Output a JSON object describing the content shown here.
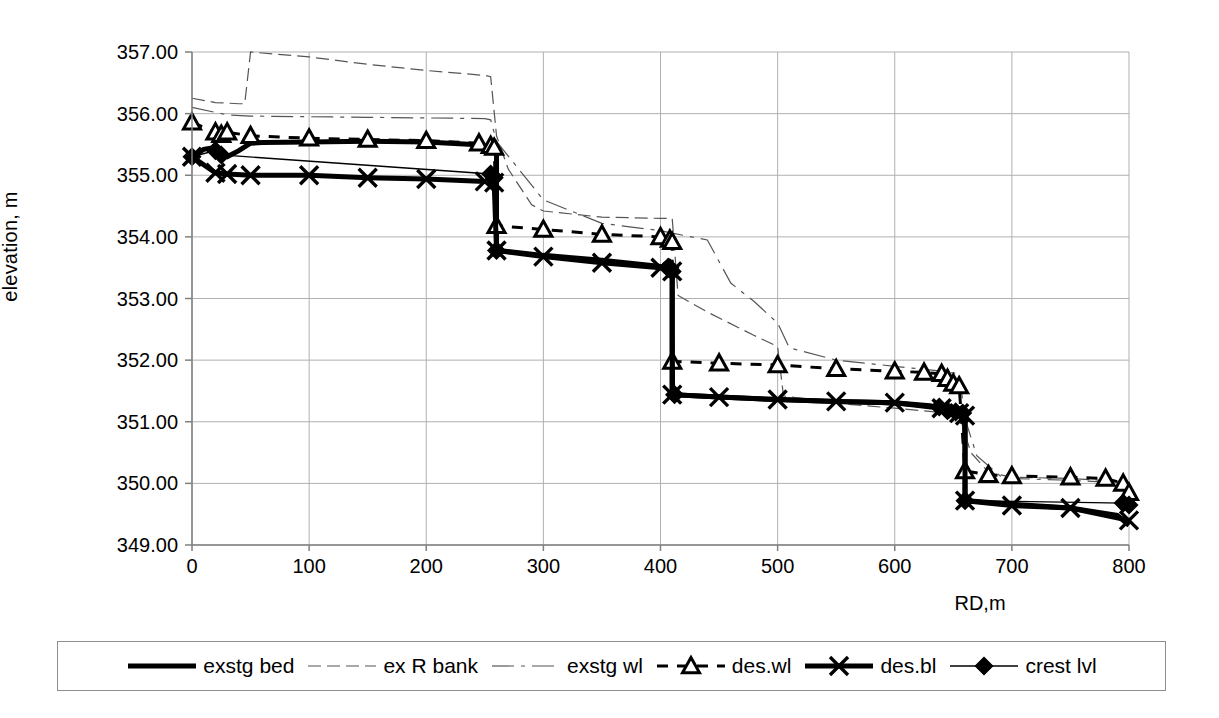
{
  "axes": {
    "y_title": "elevation, m",
    "x_title": "RD,m",
    "y_ticks": [
      "349.00",
      "350.00",
      "351.00",
      "352.00",
      "353.00",
      "354.00",
      "355.00",
      "356.00",
      "357.00"
    ],
    "x_ticks": [
      "0",
      "100",
      "200",
      "300",
      "400",
      "500",
      "600",
      "700",
      "800"
    ]
  },
  "legend": {
    "items": [
      {
        "label": "exstg bed",
        "style": "thick-solid",
        "marker": "none"
      },
      {
        "label": "ex R bank",
        "style": "thin-dashed",
        "marker": "none"
      },
      {
        "label": "exstg wl",
        "style": "thin-dash-dot-long",
        "marker": "none"
      },
      {
        "label": "des.wl",
        "style": "thin-dashed-marker",
        "marker": "triangle"
      },
      {
        "label": "des.bl",
        "style": "thick-solid-marker",
        "marker": "cross"
      },
      {
        "label": "crest lvl",
        "style": "thin-solid-marker",
        "marker": "diamond"
      }
    ]
  },
  "colors": {
    "line": "#000000",
    "grid": "#b0b0b0",
    "axis": "#808080",
    "background": "#ffffff"
  },
  "chart_data": {
    "type": "line",
    "title": "",
    "xlabel": "RD,m",
    "ylabel": "elevation, m",
    "xlim": [
      0,
      800
    ],
    "ylim": [
      349,
      357
    ],
    "ytick_step": 1,
    "xtick_step": 100,
    "grid": "both",
    "legend_position": "bottom",
    "series": [
      {
        "name": "exstg bed",
        "style": "thick-solid",
        "marker": "none",
        "points": [
          [
            0,
            355.3
          ],
          [
            10,
            355.42
          ],
          [
            20,
            355.45
          ],
          [
            25,
            355.33
          ],
          [
            30,
            355.3
          ],
          [
            40,
            355.4
          ],
          [
            50,
            355.52
          ],
          [
            60,
            355.53
          ],
          [
            100,
            355.54
          ],
          [
            150,
            355.55
          ],
          [
            200,
            355.54
          ],
          [
            240,
            355.5
          ],
          [
            250,
            355.47
          ],
          [
            258,
            355.42
          ],
          [
            260,
            355.4
          ],
          [
            260,
            353.78
          ],
          [
            262,
            353.78
          ],
          [
            300,
            353.7
          ],
          [
            350,
            353.62
          ],
          [
            400,
            353.52
          ],
          [
            408,
            353.46
          ],
          [
            410,
            353.44
          ],
          [
            410,
            351.44
          ],
          [
            412,
            351.44
          ],
          [
            450,
            351.4
          ],
          [
            500,
            351.36
          ],
          [
            550,
            351.33
          ],
          [
            600,
            351.31
          ],
          [
            630,
            351.26
          ],
          [
            640,
            351.22
          ],
          [
            650,
            351.16
          ],
          [
            658,
            351.12
          ],
          [
            660,
            351.1
          ],
          [
            660,
            349.72
          ],
          [
            662,
            349.72
          ],
          [
            700,
            349.66
          ],
          [
            750,
            349.6
          ],
          [
            790,
            349.48
          ],
          [
            800,
            349.32
          ]
        ]
      },
      {
        "name": "ex R bank",
        "style": "thin-dashed",
        "marker": "none",
        "points": [
          [
            0,
            356.25
          ],
          [
            20,
            356.18
          ],
          [
            40,
            356.16
          ],
          [
            45,
            356.16
          ],
          [
            50,
            357.0
          ],
          [
            100,
            356.92
          ],
          [
            150,
            356.8
          ],
          [
            200,
            356.7
          ],
          [
            250,
            356.62
          ],
          [
            255,
            356.6
          ],
          [
            260,
            355.64
          ],
          [
            270,
            355.1
          ],
          [
            290,
            354.52
          ],
          [
            300,
            354.42
          ],
          [
            350,
            354.32
          ],
          [
            400,
            354.3
          ],
          [
            410,
            354.3
          ],
          [
            415,
            353.05
          ],
          [
            440,
            352.78
          ],
          [
            480,
            352.4
          ],
          [
            500,
            352.22
          ],
          [
            505,
            351.42
          ],
          [
            550,
            351.3
          ],
          [
            600,
            351.22
          ],
          [
            640,
            351.15
          ],
          [
            655,
            351.12
          ],
          [
            660,
            350.8
          ],
          [
            665,
            350.5
          ],
          [
            680,
            350.18
          ],
          [
            700,
            350.1
          ],
          [
            750,
            350.08
          ],
          [
            800,
            350.02
          ]
        ]
      },
      {
        "name": "exstg wl",
        "style": "thin-dash-dot-long",
        "marker": "none",
        "points": [
          [
            0,
            356.1
          ],
          [
            30,
            355.98
          ],
          [
            50,
            355.96
          ],
          [
            100,
            355.95
          ],
          [
            150,
            355.94
          ],
          [
            200,
            355.93
          ],
          [
            250,
            355.92
          ],
          [
            255,
            355.9
          ],
          [
            260,
            355.55
          ],
          [
            300,
            354.6
          ],
          [
            350,
            354.22
          ],
          [
            400,
            354.1
          ],
          [
            410,
            354.06
          ],
          [
            440,
            353.95
          ],
          [
            460,
            353.25
          ],
          [
            480,
            352.95
          ],
          [
            500,
            352.6
          ],
          [
            510,
            352.2
          ],
          [
            550,
            352.0
          ],
          [
            600,
            351.9
          ],
          [
            640,
            351.82
          ],
          [
            655,
            351.78
          ],
          [
            660,
            351.05
          ],
          [
            670,
            350.45
          ],
          [
            690,
            350.12
          ],
          [
            700,
            350.08
          ],
          [
            750,
            350.05
          ],
          [
            800,
            350.0
          ]
        ]
      },
      {
        "name": "des.wl",
        "style": "thin-dashed-marker",
        "marker": "triangle",
        "points": [
          [
            0,
            355.86
          ],
          [
            20,
            355.7
          ],
          [
            25,
            355.66
          ],
          [
            30,
            355.7
          ],
          [
            50,
            355.64
          ],
          [
            100,
            355.6
          ],
          [
            150,
            355.58
          ],
          [
            200,
            355.56
          ],
          [
            245,
            355.52
          ],
          [
            255,
            355.48
          ],
          [
            258,
            355.45
          ],
          [
            260,
            354.18
          ],
          [
            300,
            354.12
          ],
          [
            350,
            354.04
          ],
          [
            400,
            354.0
          ],
          [
            408,
            353.96
          ],
          [
            410,
            353.92
          ],
          [
            410,
            351.98
          ],
          [
            450,
            351.95
          ],
          [
            500,
            351.92
          ],
          [
            550,
            351.86
          ],
          [
            600,
            351.82
          ],
          [
            625,
            351.8
          ],
          [
            640,
            351.78
          ],
          [
            645,
            351.7
          ],
          [
            650,
            351.62
          ],
          [
            655,
            351.58
          ],
          [
            660,
            350.2
          ],
          [
            680,
            350.14
          ],
          [
            700,
            350.12
          ],
          [
            750,
            350.1
          ],
          [
            780,
            350.08
          ],
          [
            795,
            350.0
          ],
          [
            800,
            349.85
          ]
        ]
      },
      {
        "name": "des.bl",
        "style": "thick-solid-marker",
        "marker": "cross",
        "points": [
          [
            0,
            355.3
          ],
          [
            20,
            355.04
          ],
          [
            30,
            355.02
          ],
          [
            50,
            355.0
          ],
          [
            100,
            355.0
          ],
          [
            150,
            354.96
          ],
          [
            200,
            354.94
          ],
          [
            250,
            354.9
          ],
          [
            258,
            354.88
          ],
          [
            260,
            353.78
          ],
          [
            300,
            353.68
          ],
          [
            350,
            353.58
          ],
          [
            400,
            353.5
          ],
          [
            410,
            353.44
          ],
          [
            410,
            351.44
          ],
          [
            450,
            351.4
          ],
          [
            500,
            351.36
          ],
          [
            550,
            351.33
          ],
          [
            600,
            351.31
          ],
          [
            640,
            351.22
          ],
          [
            655,
            351.14
          ],
          [
            660,
            351.1
          ],
          [
            660,
            349.72
          ],
          [
            700,
            349.64
          ],
          [
            750,
            349.6
          ],
          [
            800,
            349.4
          ]
        ]
      },
      {
        "name": "crest lvl",
        "style": "thin-solid-marker",
        "marker": "diamond",
        "points": [
          [
            0,
            355.3
          ],
          [
            20,
            355.4
          ],
          [
            25,
            355.33
          ],
          [
            255,
            355.02
          ],
          [
            258,
            354.96
          ],
          [
            260,
            353.78
          ],
          [
            408,
            353.5
          ],
          [
            410,
            353.44
          ],
          [
            412,
            351.44
          ],
          [
            638,
            351.24
          ],
          [
            645,
            351.18
          ],
          [
            652,
            351.16
          ],
          [
            658,
            351.14
          ],
          [
            660,
            349.72
          ],
          [
            795,
            349.68
          ],
          [
            800,
            349.65
          ]
        ]
      }
    ]
  }
}
